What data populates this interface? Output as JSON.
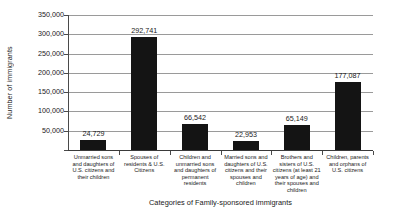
{
  "chart_data": {
    "type": "bar",
    "title": "",
    "xlabel": "Categories of Family-sponsored immigrants",
    "ylabel": "Number of immigrants",
    "ylim": [
      0,
      350000
    ],
    "ytick_step": 50000,
    "ytick_labels": [
      "350,000",
      "300,000",
      "250,000",
      "200,000",
      "150,000",
      "100,000",
      "50,000"
    ],
    "ytick_values": [
      350000,
      300000,
      250000,
      200000,
      150000,
      100000,
      50000
    ],
    "grid": true,
    "legend": false,
    "bar_color": "#141414",
    "categories": [
      "Unmarried sons and daughters of U.S. citizens and their children",
      "Spouses of residents & U.S. Citizens",
      "Children and unmarried sons and daughters of permanent residents",
      "Married sons and daughters of U.S. citizens and their spouses and children",
      "Brothers and sisters of U.S. citizens (at least 21 years of age) and their spouses and children",
      "Children, parents and orphans of U.S. citizens"
    ],
    "values": [
      24729,
      292741,
      66542,
      22953,
      65149,
      177087
    ],
    "value_labels": [
      "24,729",
      "292,741",
      "66,542",
      "22,953",
      "65,149",
      "177,087"
    ]
  }
}
